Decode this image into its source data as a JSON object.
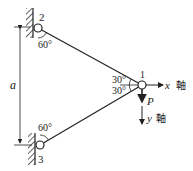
{
  "diagram": {
    "type": "truss-two-bar",
    "nodes": [
      {
        "id": "1",
        "label": "1"
      },
      {
        "id": "2",
        "label": "2"
      },
      {
        "id": "3",
        "label": "3"
      }
    ],
    "angles": {
      "node2": "60°",
      "node3": "60°",
      "node1_upper": "30°",
      "node1_lower": "30°"
    },
    "dimension": {
      "label": "a"
    },
    "load": {
      "label": "P"
    },
    "axes": {
      "x_label": "x",
      "x_suffix": "軸",
      "y_label": "y",
      "y_suffix": "軸"
    },
    "colors": {
      "line": "#222222",
      "background": "#ffffff"
    }
  }
}
